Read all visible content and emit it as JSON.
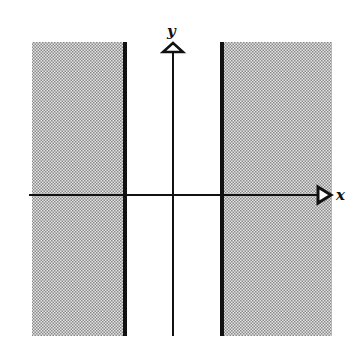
{
  "diagram": {
    "axes": {
      "x_label": "x",
      "y_label": "y"
    },
    "colors": {
      "shade": "#b8b8b8",
      "line": "#111111",
      "background": "#ffffff"
    },
    "regions": [
      {
        "name": "left-shaded-region",
        "side": "left of left boundary"
      },
      {
        "name": "right-shaded-region",
        "side": "right of right boundary"
      }
    ],
    "boundaries": [
      {
        "name": "left-boundary-line",
        "style": "solid thick"
      },
      {
        "name": "right-boundary-line",
        "style": "solid thick"
      }
    ]
  }
}
